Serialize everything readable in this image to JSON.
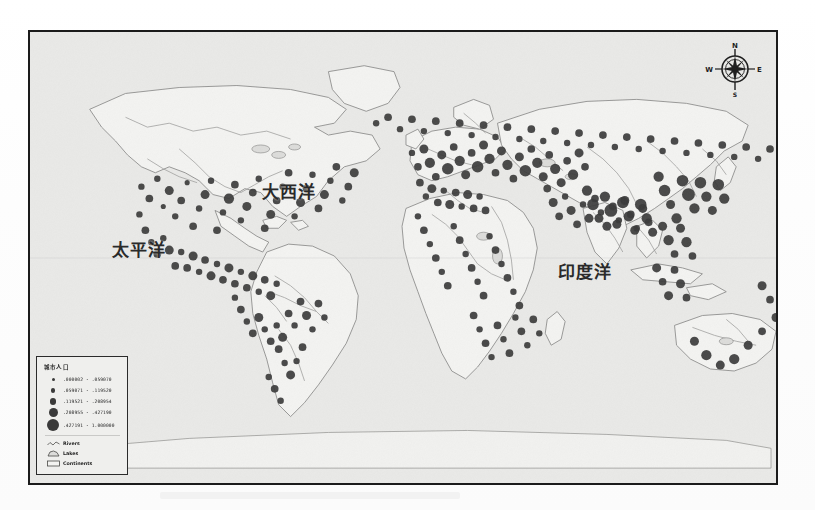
{
  "document": {
    "type": "scanned-map-figure",
    "frame_border_color": "#1b1b1b",
    "map_background_color": "#e9e9e7",
    "symbol_color": "#3a3a3a"
  },
  "map": {
    "ocean_labels": [
      {
        "name": "pacific",
        "text": "太平洋"
      },
      {
        "name": "atlantic",
        "text": "大西洋"
      },
      {
        "name": "indian",
        "text": "印度洋"
      }
    ],
    "compass": {
      "north": "N",
      "south": "S",
      "east": "E",
      "west": "W"
    }
  },
  "legend": {
    "title": "城市人口",
    "classes": [
      {
        "label": ".000002 - .059070",
        "size": 3
      },
      {
        "label": ".059071 - .119520",
        "size": 4.5
      },
      {
        "label": ".119521 - .208954",
        "size": 6.5
      },
      {
        "label": ".208955 - .427190",
        "size": 9
      },
      {
        "label": ".427191 - 1.000000",
        "size": 12
      }
    ],
    "features": [
      {
        "name": "rivers",
        "label": "Rivers",
        "symbol": "line"
      },
      {
        "name": "lakes",
        "label": "Lakes",
        "symbol": "polygon"
      },
      {
        "name": "continents",
        "label": "Continents",
        "symbol": "rect"
      }
    ]
  },
  "chart_data": {
    "type": "scatter",
    "xlabel": "Longitude",
    "ylabel": "Latitude",
    "xlim": [
      -180,
      180
    ],
    "ylim": [
      -90,
      90
    ],
    "grid": false,
    "legend_position": "bottom-left",
    "size_classes": [
      ".000002 - .059070",
      ".059071 - .119520",
      ".119521 - .208954",
      ".208955 - .427190",
      ".427191 - 1.000000"
    ],
    "region_density": [
      {
        "region": "Europe / Mediterranean",
        "density": "very-high"
      },
      {
        "region": "East Asia",
        "density": "very-high"
      },
      {
        "region": "South Asia",
        "density": "very-high"
      },
      {
        "region": "Eastern North America",
        "density": "high"
      },
      {
        "region": "Western North America",
        "density": "medium"
      },
      {
        "region": "Central America / Caribbean",
        "density": "high"
      },
      {
        "region": "South America (coastal)",
        "density": "medium"
      },
      {
        "region": "Africa",
        "density": "low-medium"
      },
      {
        "region": "Australia (coastal)",
        "density": "low"
      },
      {
        "region": "Middle East",
        "density": "medium-high"
      }
    ],
    "points": [
      [
        112,
        156,
        5
      ],
      [
        120,
        168,
        6
      ],
      [
        128,
        148,
        5
      ],
      [
        134,
        176,
        4
      ],
      [
        140,
        160,
        7
      ],
      [
        146,
        186,
        5
      ],
      [
        152,
        170,
        6
      ],
      [
        158,
        152,
        4
      ],
      [
        164,
        196,
        6
      ],
      [
        170,
        178,
        5
      ],
      [
        176,
        164,
        7
      ],
      [
        182,
        150,
        5
      ],
      [
        188,
        200,
        6
      ],
      [
        194,
        182,
        5
      ],
      [
        200,
        168,
        8
      ],
      [
        206,
        154,
        6
      ],
      [
        212,
        190,
        5
      ],
      [
        218,
        176,
        7
      ],
      [
        224,
        162,
        6
      ],
      [
        230,
        148,
        5
      ],
      [
        236,
        198,
        6
      ],
      [
        242,
        184,
        7
      ],
      [
        248,
        170,
        6
      ],
      [
        254,
        156,
        5
      ],
      [
        260,
        142,
        6
      ],
      [
        266,
        186,
        5
      ],
      [
        272,
        172,
        7
      ],
      [
        278,
        158,
        6
      ],
      [
        284,
        144,
        5
      ],
      [
        290,
        178,
        6
      ],
      [
        296,
        164,
        7
      ],
      [
        302,
        150,
        5
      ],
      [
        308,
        136,
        6
      ],
      [
        314,
        170,
        5
      ],
      [
        320,
        156,
        6
      ],
      [
        326,
        142,
        7
      ],
      [
        110,
        184,
        5
      ],
      [
        116,
        200,
        6
      ],
      [
        122,
        212,
        5
      ],
      [
        128,
        224,
        6
      ],
      [
        134,
        208,
        5
      ],
      [
        140,
        220,
        7
      ],
      [
        146,
        236,
        6
      ],
      [
        152,
        222,
        5
      ],
      [
        158,
        238,
        6
      ],
      [
        164,
        226,
        7
      ],
      [
        170,
        242,
        5
      ],
      [
        176,
        230,
        6
      ],
      [
        182,
        246,
        7
      ],
      [
        188,
        234,
        5
      ],
      [
        194,
        250,
        6
      ],
      [
        200,
        238,
        7
      ],
      [
        206,
        254,
        6
      ],
      [
        212,
        242,
        5
      ],
      [
        218,
        258,
        6
      ],
      [
        224,
        246,
        7
      ],
      [
        230,
        262,
        5
      ],
      [
        236,
        250,
        6
      ],
      [
        242,
        266,
        7
      ],
      [
        248,
        254,
        5
      ],
      [
        206,
        268,
        5
      ],
      [
        212,
        280,
        6
      ],
      [
        218,
        292,
        5
      ],
      [
        224,
        304,
        6
      ],
      [
        230,
        288,
        7
      ],
      [
        236,
        300,
        5
      ],
      [
        242,
        312,
        6
      ],
      [
        248,
        296,
        5
      ],
      [
        254,
        308,
        7
      ],
      [
        260,
        284,
        6
      ],
      [
        266,
        296,
        5
      ],
      [
        272,
        272,
        6
      ],
      [
        278,
        286,
        7
      ],
      [
        284,
        300,
        5
      ],
      [
        290,
        274,
        6
      ],
      [
        296,
        288,
        5
      ],
      [
        250,
        320,
        6
      ],
      [
        256,
        334,
        5
      ],
      [
        262,
        346,
        7
      ],
      [
        268,
        332,
        5
      ],
      [
        274,
        318,
        6
      ],
      [
        240,
        348,
        5
      ],
      [
        246,
        360,
        6
      ],
      [
        252,
        372,
        5
      ],
      [
        384,
        122,
        5
      ],
      [
        390,
        136,
        6
      ],
      [
        396,
        118,
        7
      ],
      [
        402,
        132,
        8
      ],
      [
        408,
        146,
        6
      ],
      [
        414,
        124,
        7
      ],
      [
        420,
        138,
        9
      ],
      [
        426,
        116,
        6
      ],
      [
        432,
        130,
        8
      ],
      [
        438,
        144,
        7
      ],
      [
        444,
        122,
        6
      ],
      [
        450,
        136,
        9
      ],
      [
        456,
        114,
        7
      ],
      [
        462,
        128,
        8
      ],
      [
        468,
        142,
        6
      ],
      [
        474,
        120,
        7
      ],
      [
        480,
        134,
        8
      ],
      [
        486,
        148,
        6
      ],
      [
        492,
        126,
        7
      ],
      [
        498,
        140,
        9
      ],
      [
        504,
        118,
        6
      ],
      [
        510,
        132,
        8
      ],
      [
        516,
        146,
        7
      ],
      [
        522,
        124,
        6
      ],
      [
        528,
        138,
        8
      ],
      [
        534,
        152,
        7
      ],
      [
        540,
        130,
        6
      ],
      [
        546,
        144,
        8
      ],
      [
        552,
        122,
        7
      ],
      [
        558,
        136,
        6
      ],
      [
        392,
        152,
        6
      ],
      [
        398,
        166,
        5
      ],
      [
        404,
        158,
        7
      ],
      [
        410,
        172,
        6
      ],
      [
        416,
        160,
        5
      ],
      [
        422,
        174,
        7
      ],
      [
        428,
        162,
        6
      ],
      [
        434,
        176,
        5
      ],
      [
        440,
        164,
        7
      ],
      [
        446,
        178,
        6
      ],
      [
        452,
        166,
        5
      ],
      [
        458,
        180,
        6
      ],
      [
        390,
        186,
        5
      ],
      [
        396,
        200,
        6
      ],
      [
        402,
        214,
        5
      ],
      [
        408,
        228,
        6
      ],
      [
        414,
        242,
        5
      ],
      [
        420,
        256,
        6
      ],
      [
        426,
        196,
        5
      ],
      [
        432,
        210,
        6
      ],
      [
        438,
        224,
        5
      ],
      [
        444,
        238,
        6
      ],
      [
        450,
        252,
        5
      ],
      [
        456,
        266,
        6
      ],
      [
        462,
        206,
        5
      ],
      [
        468,
        220,
        6
      ],
      [
        474,
        234,
        5
      ],
      [
        480,
        248,
        6
      ],
      [
        486,
        262,
        5
      ],
      [
        492,
        276,
        6
      ],
      [
        446,
        286,
        6
      ],
      [
        452,
        300,
        5
      ],
      [
        458,
        314,
        6
      ],
      [
        464,
        328,
        5
      ],
      [
        470,
        296,
        6
      ],
      [
        476,
        310,
        5
      ],
      [
        482,
        324,
        6
      ],
      [
        488,
        288,
        5
      ],
      [
        494,
        302,
        6
      ],
      [
        500,
        316,
        5
      ],
      [
        506,
        290,
        6
      ],
      [
        512,
        304,
        5
      ],
      [
        520,
        158,
        6
      ],
      [
        526,
        172,
        7
      ],
      [
        532,
        186,
        6
      ],
      [
        538,
        166,
        5
      ],
      [
        544,
        180,
        7
      ],
      [
        550,
        194,
        6
      ],
      [
        556,
        174,
        5
      ],
      [
        562,
        188,
        7
      ],
      [
        568,
        168,
        6
      ],
      [
        574,
        182,
        5
      ],
      [
        580,
        196,
        7
      ],
      [
        586,
        176,
        6
      ],
      [
        592,
        190,
        5
      ],
      [
        598,
        170,
        7
      ],
      [
        604,
        184,
        6
      ],
      [
        610,
        198,
        5
      ],
      [
        616,
        178,
        7
      ],
      [
        622,
        192,
        6
      ],
      [
        560,
        160,
        8
      ],
      [
        566,
        174,
        9
      ],
      [
        572,
        188,
        7
      ],
      [
        578,
        166,
        8
      ],
      [
        584,
        180,
        10
      ],
      [
        590,
        194,
        7
      ],
      [
        596,
        172,
        9
      ],
      [
        602,
        186,
        8
      ],
      [
        608,
        200,
        7
      ],
      [
        614,
        174,
        9
      ],
      [
        620,
        188,
        8
      ],
      [
        626,
        202,
        7
      ],
      [
        632,
        146,
        8
      ],
      [
        638,
        160,
        9
      ],
      [
        644,
        174,
        7
      ],
      [
        650,
        188,
        8
      ],
      [
        656,
        150,
        9
      ],
      [
        662,
        164,
        10
      ],
      [
        668,
        178,
        8
      ],
      [
        674,
        152,
        9
      ],
      [
        680,
        166,
        8
      ],
      [
        686,
        180,
        7
      ],
      [
        692,
        154,
        9
      ],
      [
        698,
        168,
        8
      ],
      [
        636,
        196,
        7
      ],
      [
        642,
        210,
        8
      ],
      [
        648,
        224,
        6
      ],
      [
        654,
        198,
        7
      ],
      [
        660,
        212,
        8
      ],
      [
        666,
        226,
        6
      ],
      [
        630,
        238,
        7
      ],
      [
        636,
        252,
        6
      ],
      [
        642,
        266,
        7
      ],
      [
        648,
        240,
        6
      ],
      [
        654,
        254,
        7
      ],
      [
        660,
        268,
        6
      ],
      [
        668,
        312,
        7
      ],
      [
        680,
        326,
        8
      ],
      [
        694,
        336,
        7
      ],
      [
        708,
        330,
        8
      ],
      [
        722,
        316,
        7
      ],
      [
        736,
        302,
        6
      ],
      [
        750,
        288,
        7
      ],
      [
        744,
        270,
        6
      ],
      [
        736,
        256,
        7
      ],
      [
        756,
        244,
        6
      ],
      [
        764,
        230,
        7
      ],
      [
        770,
        216,
        6
      ],
      [
        348,
        92,
        5
      ],
      [
        360,
        86,
        6
      ],
      [
        372,
        98,
        5
      ],
      [
        384,
        88,
        6
      ],
      [
        396,
        100,
        5
      ],
      [
        408,
        90,
        6
      ],
      [
        420,
        102,
        5
      ],
      [
        432,
        92,
        6
      ],
      [
        444,
        104,
        5
      ],
      [
        456,
        94,
        6
      ],
      [
        468,
        106,
        5
      ],
      [
        480,
        96,
        6
      ],
      [
        492,
        108,
        5
      ],
      [
        504,
        98,
        6
      ],
      [
        516,
        110,
        5
      ],
      [
        528,
        100,
        6
      ],
      [
        540,
        112,
        5
      ],
      [
        552,
        102,
        6
      ],
      [
        564,
        114,
        5
      ],
      [
        576,
        104,
        6
      ],
      [
        588,
        116,
        5
      ],
      [
        600,
        106,
        6
      ],
      [
        612,
        118,
        5
      ],
      [
        624,
        108,
        6
      ],
      [
        636,
        120,
        5
      ],
      [
        648,
        110,
        6
      ],
      [
        660,
        122,
        5
      ],
      [
        672,
        112,
        6
      ],
      [
        684,
        124,
        5
      ],
      [
        696,
        114,
        6
      ],
      [
        708,
        126,
        5
      ],
      [
        720,
        116,
        6
      ],
      [
        732,
        128,
        5
      ],
      [
        744,
        118,
        6
      ]
    ]
  }
}
